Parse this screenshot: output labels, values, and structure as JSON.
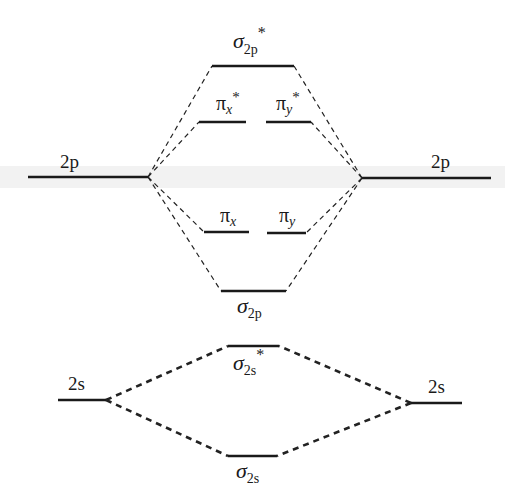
{
  "atomic_orbitals": {
    "left_2p": {
      "label": "2p",
      "x1": 28,
      "x2": 148,
      "y": 177
    },
    "right_2p": {
      "label": "2p",
      "x1": 362,
      "x2": 491,
      "y": 178
    },
    "left_2s": {
      "label": "2s",
      "x1": 58,
      "x2": 106,
      "y": 400
    },
    "right_2s": {
      "label": "2s",
      "x1": 411,
      "x2": 462,
      "y": 403
    }
  },
  "molecular_orbitals": {
    "sigma_2p_star": {
      "symbol": "σ",
      "sub": "2p",
      "sup": "*",
      "x1": 212,
      "x2": 294,
      "y": 66
    },
    "pi_x_star": {
      "symbol": "π",
      "sub": "x",
      "sup": "*",
      "x1": 199,
      "x2": 246,
      "y": 122
    },
    "pi_y_star": {
      "symbol": "π",
      "sub": "y",
      "sup": "*",
      "x1": 266,
      "x2": 311,
      "y": 122
    },
    "pi_x": {
      "symbol": "π",
      "sub": "x",
      "sup": "",
      "x1": 204,
      "x2": 249,
      "y": 232
    },
    "pi_y": {
      "symbol": "π",
      "sub": "y",
      "sup": "",
      "x1": 267,
      "x2": 306,
      "y": 233
    },
    "sigma_2p": {
      "symbol": "σ",
      "sub": "2p",
      "sup": "",
      "x1": 221,
      "x2": 286,
      "y": 291
    },
    "sigma_2s_star": {
      "symbol": "σ",
      "sub": "2s",
      "sup": "*",
      "x1": 228,
      "x2": 279,
      "y": 346
    },
    "sigma_2s": {
      "symbol": "σ",
      "sub": "2s",
      "sup": "",
      "x1": 228,
      "x2": 277,
      "y": 456
    }
  },
  "connections": {
    "style_2p": "thin dashed",
    "style_2s": "bold dashed"
  }
}
